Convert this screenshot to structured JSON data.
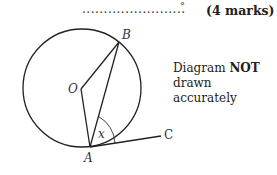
{
  "answer": {
    "dots": "........................",
    "unit": "°",
    "marks": "(4 marks)"
  },
  "note": {
    "line1_prefix": "Diagram ",
    "line1_bold": "NOT",
    "line2": "drawn accurately"
  },
  "diagram": {
    "labels": {
      "B": "B",
      "O": "O",
      "A": "A",
      "C": "C",
      "x": "x"
    },
    "circle": {
      "cx": 82,
      "cy": 88,
      "r": 59
    },
    "points": {
      "O": [
        81,
        89
      ],
      "A": [
        90,
        147
      ],
      "B": [
        119,
        42
      ],
      "C": [
        161,
        136
      ]
    }
  }
}
